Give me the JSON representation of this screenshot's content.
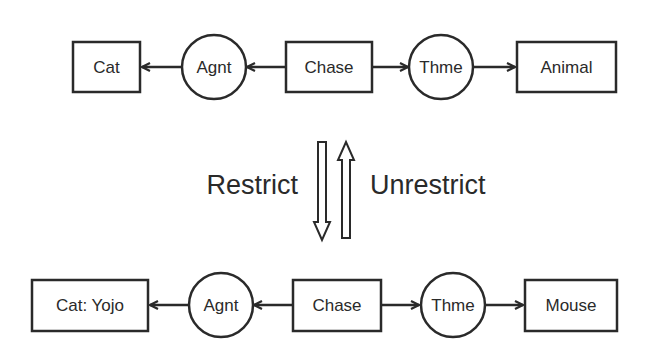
{
  "top_graph": {
    "nodes": [
      {
        "id": "cat",
        "type": "concept",
        "label": "Cat"
      },
      {
        "id": "agnt",
        "type": "relation",
        "label": "Agnt"
      },
      {
        "id": "chase",
        "type": "concept",
        "label": "Chase"
      },
      {
        "id": "thme",
        "type": "relation",
        "label": "Thme"
      },
      {
        "id": "animal",
        "type": "concept",
        "label": "Animal"
      }
    ],
    "edges": [
      {
        "from": "agnt",
        "to": "cat"
      },
      {
        "from": "chase",
        "to": "agnt"
      },
      {
        "from": "chase",
        "to": "thme"
      },
      {
        "from": "thme",
        "to": "animal"
      }
    ]
  },
  "operations": {
    "down_label": "Restrict",
    "up_label": "Unrestrict"
  },
  "bottom_graph": {
    "nodes": [
      {
        "id": "cat_yojo",
        "type": "concept",
        "label": "Cat: Yojo"
      },
      {
        "id": "agnt",
        "type": "relation",
        "label": "Agnt"
      },
      {
        "id": "chase",
        "type": "concept",
        "label": "Chase"
      },
      {
        "id": "thme",
        "type": "relation",
        "label": "Thme"
      },
      {
        "id": "mouse",
        "type": "concept",
        "label": "Mouse"
      }
    ],
    "edges": [
      {
        "from": "agnt",
        "to": "cat_yojo"
      },
      {
        "from": "chase",
        "to": "agnt"
      },
      {
        "from": "chase",
        "to": "thme"
      },
      {
        "from": "thme",
        "to": "mouse"
      }
    ]
  },
  "colors": {
    "stroke": "#2a2a2a",
    "background": "#ffffff"
  }
}
